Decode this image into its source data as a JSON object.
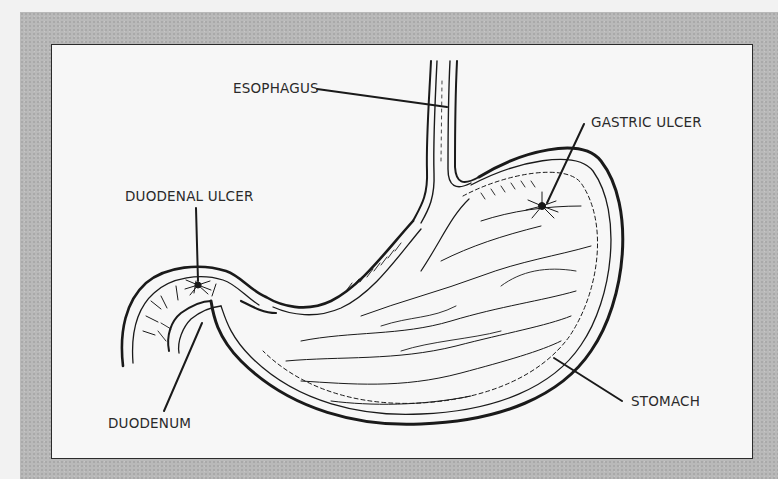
{
  "diagram": {
    "labels": {
      "esophagus": "ESOPHAGUS",
      "gastric_ulcer": "GASTRIC ULCER",
      "duodenal_ulcer": "DUODENAL ULCER",
      "duodenum": "DUODENUM",
      "stomach": "STOMACH"
    },
    "colors": {
      "frame": "#b9b9b9",
      "panel": "#f7f7f7",
      "ink": "#1a1a1a"
    }
  }
}
